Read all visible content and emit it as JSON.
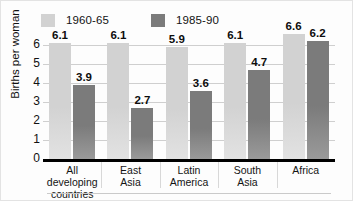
{
  "chart_data": {
    "type": "bar",
    "title": "",
    "subtitle": "",
    "xlabel": "",
    "ylabel": "Births per woman",
    "ylim": [
      0,
      6
    ],
    "y_ticks": [
      0,
      1,
      2,
      3,
      4,
      5,
      6
    ],
    "grid": true,
    "legend_position": "top",
    "categories": [
      "All developing\ncountries",
      "East\nAsia",
      "Latin\nAmerica",
      "South\nAsia",
      "Africa"
    ],
    "series": [
      {
        "name": "1960-65",
        "color": "#d2d2d2",
        "values": [
          6.1,
          6.1,
          5.9,
          6.1,
          6.6
        ],
        "labels": [
          "6.1",
          "6.1",
          "5.9",
          "6.1",
          "6.6"
        ]
      },
      {
        "name": "1985-90",
        "color": "#7b7b7b",
        "values": [
          3.9,
          2.7,
          3.6,
          4.7,
          6.2
        ],
        "labels": [
          "3.9",
          "2.7",
          "3.6",
          "4.7",
          "6.2"
        ]
      }
    ]
  },
  "legend": {
    "entries": [
      {
        "label": "1960-65",
        "swatch": "#d2d2d2"
      },
      {
        "label": "1985-90",
        "swatch": "#7b7b7b"
      }
    ]
  },
  "axis": {
    "y_title": "Births per woman",
    "y_tick_labels": [
      "6",
      "5",
      "4",
      "3",
      "2",
      "1",
      "0"
    ]
  }
}
